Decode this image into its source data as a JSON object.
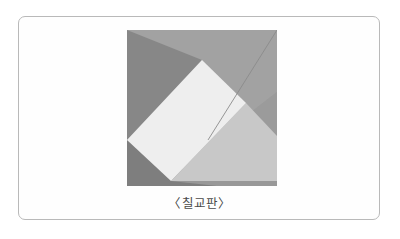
{
  "page": {
    "background_color": "#ffffff",
    "width": 400,
    "height": 239
  },
  "panel": {
    "border_color": "#b9b9b9",
    "background_color": "#fefefe",
    "corner_radius": 7
  },
  "figure": {
    "caption": "〈칠교판〉",
    "caption_color": "#4a4a4a",
    "alt_name": "tangram-square",
    "piece_count": 7,
    "square_background": "#9d9d9d",
    "pieces": [
      {
        "id": "large-triangle-upper-left",
        "shape": "triangle",
        "color": "#8a8a8a",
        "points": "0,0 0,108 74,29"
      },
      {
        "id": "large-triangle-upper-right",
        "shape": "triangle",
        "color": "#a0a0a0",
        "points": "0,0 150,0 150,60 78,116"
      },
      {
        "id": "small-triangle-top-right",
        "shape": "triangle",
        "color": "#a3a3a3",
        "points": "150,0 150,110 90,40"
      },
      {
        "id": "square-center",
        "shape": "square",
        "color": "#eeeeee",
        "points": "74,29 0,108 43,150 118,72"
      },
      {
        "id": "medium-triangle-center",
        "shape": "triangle",
        "color": "#c9c9c9",
        "points": "118,72 43,150 150,150 150,105"
      },
      {
        "id": "large-triangle-bottom-left",
        "shape": "triangle",
        "color": "#808080",
        "points": "0,108 0,156 88,156"
      },
      {
        "id": "parallelogram-bottom",
        "shape": "parallelogram",
        "color": "#9a9a9a",
        "points": "43,150 150,150 150,156 88,156"
      }
    ],
    "guide_line": {
      "id": "diagonal-guide",
      "color": "#8c8c8c",
      "from": "150,0",
      "to": "82,108"
    }
  }
}
